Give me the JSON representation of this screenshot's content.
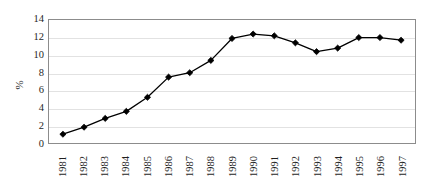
{
  "chart_data": {
    "type": "line",
    "title": "",
    "subtitle": "",
    "xlabel": "",
    "ylabel": "%",
    "categories": [
      "1981",
      "1982",
      "1983",
      "1984",
      "1985",
      "1986",
      "1987",
      "1988",
      "1989",
      "1990",
      "1991",
      "1992",
      "1993",
      "1994",
      "1995",
      "1996",
      "1997"
    ],
    "values": [
      1.0,
      1.8,
      2.8,
      3.6,
      5.2,
      7.5,
      8.0,
      9.4,
      11.9,
      12.4,
      12.2,
      11.4,
      10.4,
      10.8,
      12.0,
      12.0,
      11.7
    ],
    "series": [
      {
        "name": "%",
        "values": [
          1.0,
          1.8,
          2.8,
          3.6,
          5.2,
          7.5,
          8.0,
          9.4,
          11.9,
          12.4,
          12.2,
          11.4,
          10.4,
          10.8,
          12.0,
          12.0,
          11.7
        ]
      }
    ],
    "ylim": [
      0,
      14
    ],
    "yticks": [
      0,
      2,
      4,
      6,
      8,
      10,
      12,
      14
    ],
    "ytick_labels": [
      "0",
      "2",
      "4",
      "6",
      "8",
      "10",
      "12",
      "14"
    ],
    "grid": "horizontal",
    "legend": "none",
    "marker": "diamond",
    "colors": {
      "line": "#000000",
      "marker": "#000000",
      "gridline": "#e2e2e2",
      "plot_border": "#8c8c8c",
      "background": "#ffffff",
      "text": "#1f1f1f"
    }
  }
}
